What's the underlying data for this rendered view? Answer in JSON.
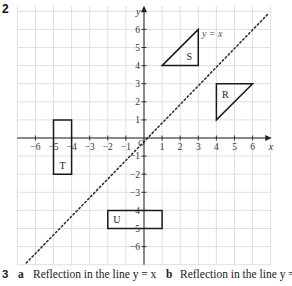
{
  "question2": {
    "number": "2",
    "grid": {
      "x_axis_label": "x",
      "y_axis_label": "y",
      "x_ticks": [
        "−6",
        "−5",
        "−4",
        "−3",
        "−2",
        "−1",
        "1",
        "2",
        "3",
        "4",
        "5",
        "6"
      ],
      "y_ticks": [
        "6",
        "5",
        "4",
        "3",
        "2",
        "1",
        "−1",
        "−2",
        "−3",
        "−4",
        "−5",
        "−6"
      ],
      "origin_label": "O",
      "line_label": "y = x",
      "colors": {
        "grid": "#d8d8d8",
        "axis": "#222222",
        "shape": "#1a1a1a",
        "dotted_line": "#333333"
      }
    },
    "shapes": [
      {
        "label": "S",
        "type": "triangle",
        "vertices": [
          [
            1,
            4
          ],
          [
            3,
            4
          ],
          [
            3,
            6
          ]
        ]
      },
      {
        "label": "R",
        "type": "triangle",
        "vertices": [
          [
            4,
            1
          ],
          [
            4,
            3
          ],
          [
            6,
            3
          ]
        ]
      },
      {
        "label": "T",
        "type": "rectangle",
        "vertices": [
          [
            -5,
            1
          ],
          [
            -4,
            1
          ],
          [
            -4,
            -2
          ],
          [
            -5,
            -2
          ]
        ]
      },
      {
        "label": "U",
        "type": "rectangle",
        "vertices": [
          [
            -2,
            -4
          ],
          [
            1,
            -4
          ],
          [
            1,
            -5
          ],
          [
            -2,
            -5
          ]
        ]
      }
    ]
  },
  "question3": {
    "number": "3",
    "part_a_label": "a",
    "part_a_text": "Reflection in the line y = x",
    "part_b_label": "b",
    "part_b_text": "Reflection in the line y = −x"
  }
}
